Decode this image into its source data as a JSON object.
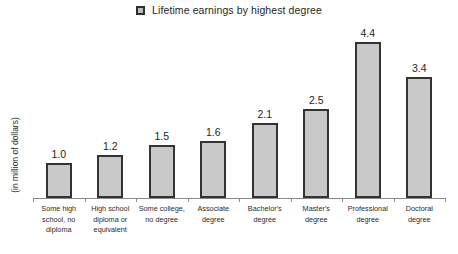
{
  "legend": {
    "marker": "square-marker",
    "label": "Lifetime earnings by highest degree"
  },
  "axis": {
    "ylabel": "(in million of dollars)"
  },
  "chart_data": {
    "type": "bar",
    "title": "",
    "subtitle": "",
    "xlabel": "",
    "ylabel": "(in million of dollars)",
    "ylim": [
      0,
      5
    ],
    "grid": false,
    "legend_position": "top-center",
    "legend_entries": [
      "Lifetime earnings by highest degree"
    ],
    "categories": [
      "Some high school, no diploma",
      "High school diploma or equivalent",
      "Some college, no degree",
      "Associate degree",
      "Bachelor's degree",
      "Master's degree",
      "Professional degree",
      "Doctoral degree"
    ],
    "category_lines": [
      [
        "Some high",
        "school, no",
        "diploma"
      ],
      [
        "High school",
        "diploma or",
        "equivalent"
      ],
      [
        "Some college,",
        "no degree"
      ],
      [
        "Associate",
        "degree"
      ],
      [
        "Bachelor's",
        "degree"
      ],
      [
        "Master's",
        "degree"
      ],
      [
        "Professional",
        "degree"
      ],
      [
        "Doctoral",
        "degree"
      ]
    ],
    "values": [
      1.0,
      1.2,
      1.5,
      1.6,
      2.1,
      2.5,
      4.4,
      3.4
    ],
    "value_labels": [
      "1.0",
      "1.2",
      "1.5",
      "1.6",
      "2.1",
      "2.5",
      "4.4",
      "3.4"
    ],
    "bar_fill": "#c9c9c9",
    "bar_border": "#333333"
  }
}
